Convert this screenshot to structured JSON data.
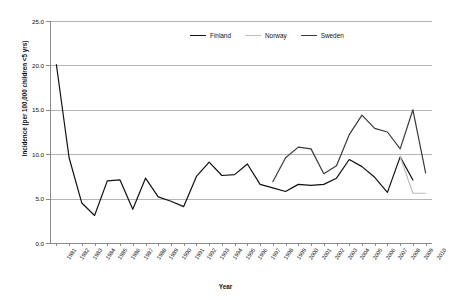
{
  "chart_data": {
    "type": "line",
    "title": "",
    "xlabel": "Year",
    "ylabel": "Incidence (per 100,000 children <5 yrs)",
    "ylim": [
      0.0,
      25.0
    ],
    "yticks": [
      "0.0",
      "5.0",
      "10.0",
      "15.0",
      "20.0",
      "25.0"
    ],
    "ytick_values": [
      0.0,
      5.0,
      10.0,
      15.0,
      20.0,
      25.0
    ],
    "grid": "horizontal",
    "legend_position": "top-center",
    "categories": [
      "1981",
      "1982",
      "1983",
      "1984",
      "1985",
      "1986",
      "1987",
      "1988",
      "1989",
      "1990",
      "1991",
      "1992",
      "1993",
      "1994",
      "1995",
      "1996",
      "1997",
      "1998",
      "1999",
      "2000",
      "2001",
      "2002",
      "2003",
      "2004",
      "2005",
      "2006",
      "2007",
      "2008",
      "2009",
      "2010"
    ],
    "series": [
      {
        "name": "Finland",
        "color": "#111111",
        "values": [
          20.1,
          9.6,
          4.5,
          3.1,
          7.0,
          7.1,
          3.8,
          7.3,
          5.2,
          4.7,
          4.1,
          7.5,
          9.1,
          7.6,
          7.7,
          8.9,
          6.6,
          6.2,
          5.8,
          6.6,
          6.5,
          6.6,
          7.3,
          9.4,
          8.6,
          7.4,
          5.7,
          9.7,
          7.1,
          null
        ]
      },
      {
        "name": "Norway",
        "color": "#bdbdbd",
        "values": [
          null,
          null,
          null,
          null,
          null,
          null,
          null,
          null,
          null,
          null,
          null,
          null,
          null,
          null,
          null,
          null,
          null,
          null,
          null,
          null,
          null,
          null,
          null,
          null,
          null,
          null,
          null,
          9.7,
          5.6,
          5.6
        ]
      },
      {
        "name": "Sweden",
        "color": "#3a3a3a",
        "values": [
          null,
          null,
          null,
          null,
          null,
          null,
          null,
          null,
          null,
          null,
          null,
          null,
          null,
          null,
          null,
          null,
          null,
          6.9,
          9.6,
          10.8,
          10.6,
          7.8,
          8.7,
          12.2,
          14.4,
          12.9,
          12.5,
          10.6,
          15.0,
          7.9
        ]
      }
    ],
    "legend": [
      {
        "label": "Finland",
        "color": "#111111"
      },
      {
        "label": "Norway",
        "color": "#bdbdbd"
      },
      {
        "label": "Sweden",
        "color": "#3a3a3a"
      }
    ],
    "colors": {
      "gridline": "#b5b5b5",
      "axis": "#8a8a8a",
      "background": "#ffffff",
      "text": "#111111"
    }
  }
}
